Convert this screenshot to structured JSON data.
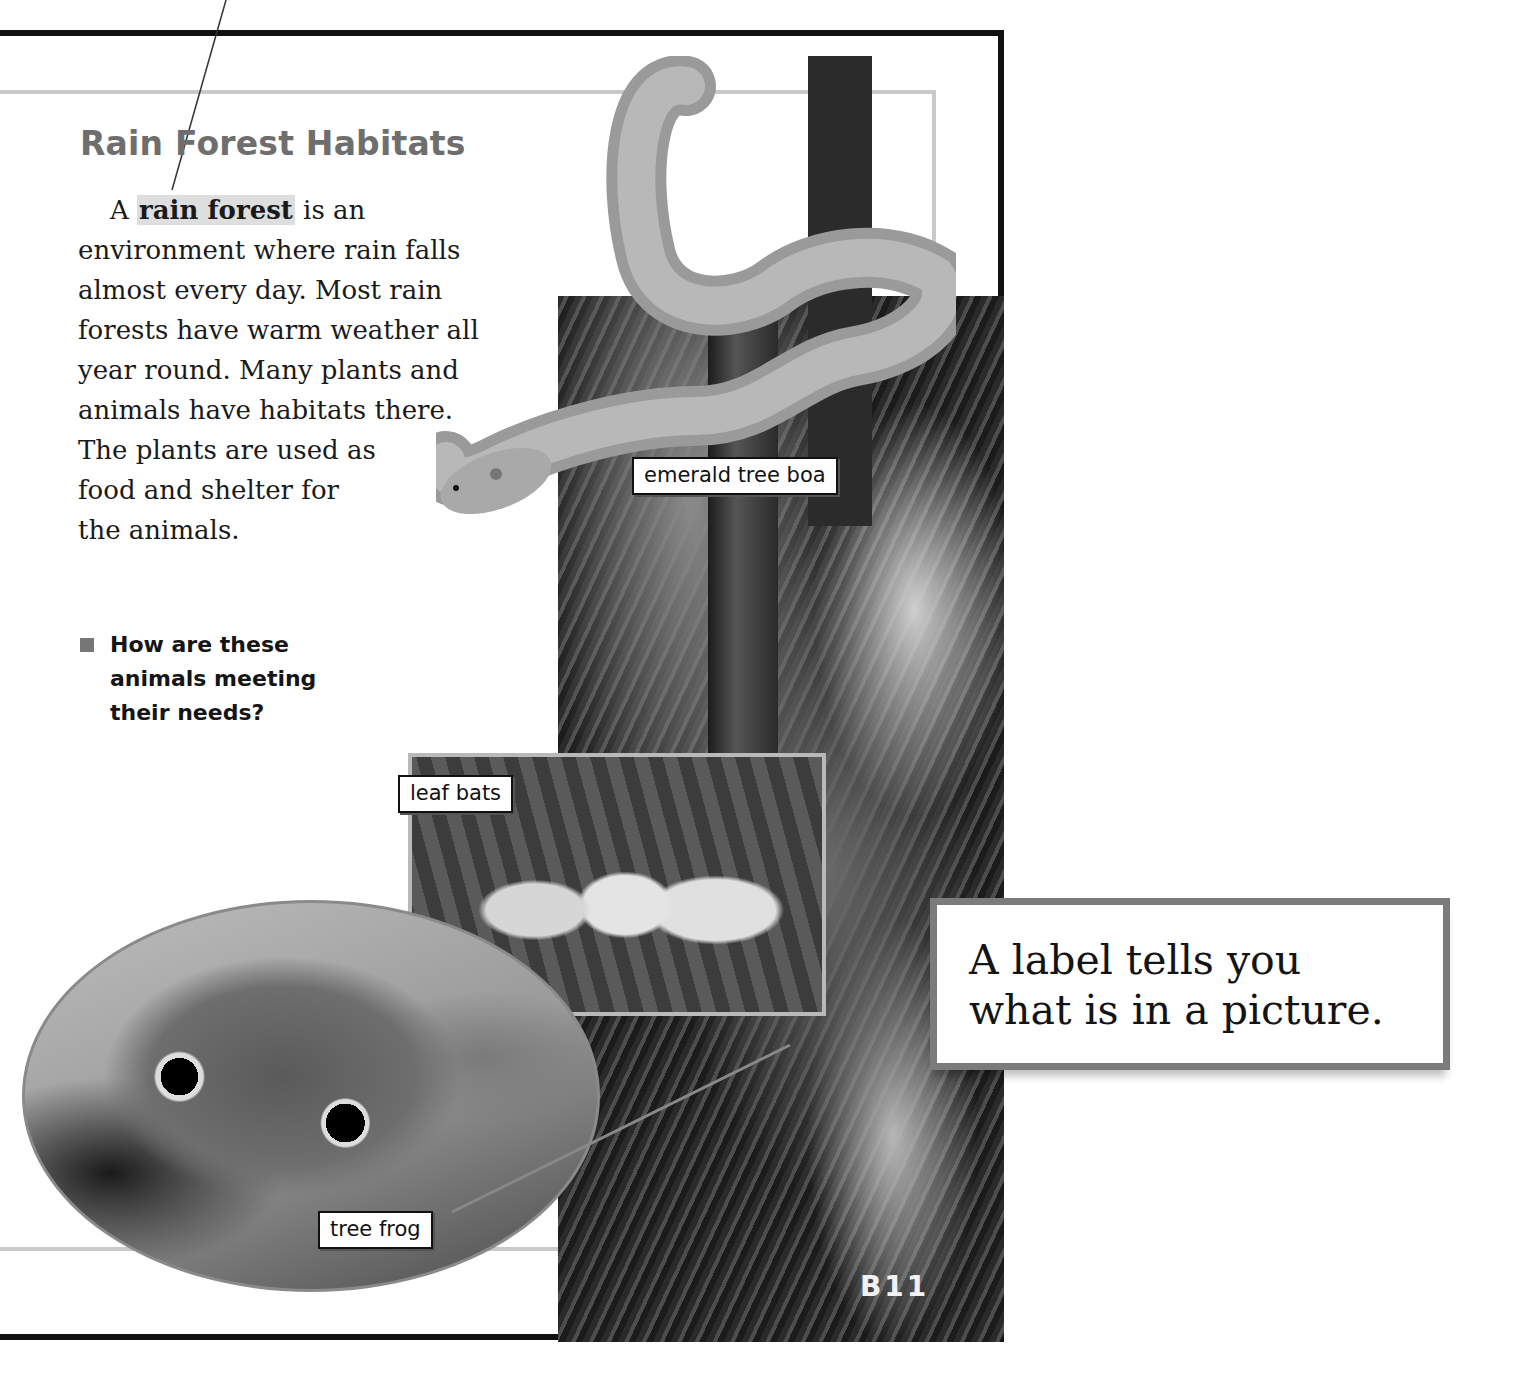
{
  "section": {
    "heading": "Rain Forest Habitats",
    "paragraph": {
      "lead": "A",
      "term": "rain forest",
      "after_term": "is an",
      "lines": [
        "environment where rain falls",
        "almost every day. Most rain",
        "forests have warm weather all",
        "year round. Many plants and",
        "animals have habitats there.",
        "The plants are used as",
        "food and shelter for",
        "the animals."
      ]
    },
    "question": {
      "lines": [
        "How are these",
        "animals meeting",
        "their needs?"
      ]
    }
  },
  "photos": {
    "labels": {
      "boa": "emerald tree boa",
      "bats": "leaf bats",
      "frog": "tree frog"
    }
  },
  "page_number": "B11",
  "callout": {
    "lines": [
      "A label tells you",
      "what is in a picture."
    ]
  },
  "colors": {
    "heading": "#6e6e6e",
    "term_highlight": "#dedede",
    "frame": "#111111",
    "inner_rule": "#c9c9c9",
    "callout_border": "#7b7b7b"
  }
}
